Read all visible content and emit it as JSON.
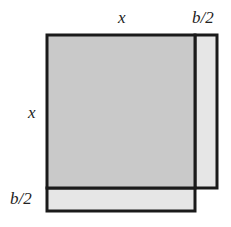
{
  "diagram": {
    "labels": {
      "top_x": "x",
      "top_half_b": "b/2",
      "left_x": "x",
      "left_half_b": "b/2"
    },
    "shapes": {
      "main_square": {
        "x": 47,
        "y": 35,
        "w": 148,
        "h": 153,
        "fill": "#c9c9c9",
        "stroke": "#1a1a1a"
      },
      "right_strip": {
        "x": 195,
        "y": 35,
        "w": 22,
        "h": 153,
        "fill": "#e6e6e6",
        "stroke": "#1a1a1a"
      },
      "bottom_strip": {
        "x": 47,
        "y": 188,
        "w": 148,
        "h": 23,
        "fill": "#e6e6e6",
        "stroke": "#1a1a1a"
      }
    },
    "colors": {
      "stroke": "#1a1a1a",
      "square_fill": "#c9c9c9",
      "strip_fill": "#e6e6e6",
      "text": "#222222"
    }
  }
}
